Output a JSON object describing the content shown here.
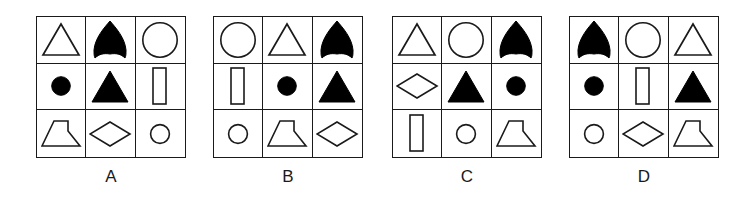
{
  "figure": {
    "type": "matrix-reasoning-options",
    "panel_count": 4,
    "grid_rows": 3,
    "grid_cols": 3,
    "stroke_color": "#1a1a1a",
    "fill_color": "#000000",
    "background_color": "#ffffff",
    "shape_legend": {
      "triangle-outline": "outline triangle",
      "bullet-filled": "filled bullet / shield dome shape",
      "circle-outline": "outline circle (large)",
      "circle-filled": "filled small circle / dot",
      "triangle-filled": "filled triangle",
      "rectangle-outline": "outline tall rectangle",
      "funnel-outline": "outline funnel / lamp trapezoid",
      "diamond-outline": "outline diamond / rhombus",
      "circle-outline-small": "outline small circle"
    }
  },
  "panels": [
    {
      "label": "A",
      "x": 36,
      "width": 150,
      "height": 142,
      "cells": [
        "triangle-outline",
        "bullet-filled",
        "circle-outline",
        "circle-filled",
        "triangle-filled",
        "rectangle-outline",
        "funnel-outline",
        "diamond-outline",
        "circle-outline-small"
      ]
    },
    {
      "label": "B",
      "x": 213,
      "width": 150,
      "height": 142,
      "cells": [
        "circle-outline",
        "triangle-outline",
        "bullet-filled",
        "rectangle-outline",
        "circle-filled",
        "triangle-filled",
        "circle-outline-small",
        "funnel-outline",
        "diamond-outline"
      ]
    },
    {
      "label": "C",
      "x": 392,
      "width": 150,
      "height": 142,
      "cells": [
        "triangle-outline",
        "circle-outline",
        "bullet-filled",
        "diamond-outline",
        "triangle-filled",
        "circle-filled",
        "rectangle-outline",
        "circle-outline-small",
        "funnel-outline"
      ]
    },
    {
      "label": "D",
      "x": 569,
      "width": 150,
      "height": 142,
      "cells": [
        "bullet-filled",
        "circle-outline",
        "triangle-outline",
        "circle-filled",
        "rectangle-outline",
        "triangle-filled",
        "circle-outline-small",
        "diamond-outline",
        "funnel-outline"
      ]
    }
  ]
}
